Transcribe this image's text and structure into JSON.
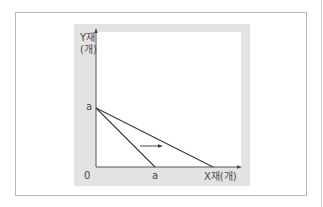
{
  "diagram": {
    "y_axis_label_line1": "Y재",
    "y_axis_label_line2": "(개)",
    "x_axis_label": "X재(개)",
    "origin_label": "0",
    "y_intercept_label": "a",
    "x_intercept_label": "a",
    "lines": [
      {
        "name": "original-budget-line",
        "from": "(0, a)",
        "to": "(a, 0)"
      },
      {
        "name": "rotated-budget-line",
        "from": "(0, a)",
        "to": "(~2a, 0)"
      }
    ],
    "shift_arrow": "rightward",
    "colors": {
      "axis": "#555555",
      "line": "#3a3a3a",
      "panel": "#e3e3e3",
      "frame": "#b9b9b9"
    }
  }
}
